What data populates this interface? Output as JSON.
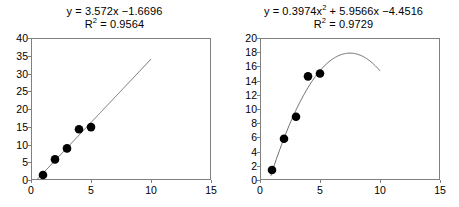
{
  "figure": {
    "background": "#ffffff",
    "point_color": "#000000",
    "line_color": "#6e6e6e",
    "axis_color": "#808080"
  },
  "chart_data": [
    {
      "type": "scatter",
      "title": "",
      "annotations": [
        {
          "text_parts": [
            "y = 3.572x −1.6696"
          ]
        },
        {
          "text_parts": [
            "R",
            "2",
            " = 0.9564"
          ]
        }
      ],
      "equation": "y = 3.572x −1.6696",
      "r_squared_label": "R",
      "r_squared_sup": "2",
      "r_squared_value": " = 0.9564",
      "xlabel": "",
      "ylabel": "",
      "xlim": [
        0,
        15
      ],
      "ylim": [
        0,
        40
      ],
      "xticks": [
        0,
        5,
        10,
        15
      ],
      "yticks": [
        0,
        5,
        10,
        15,
        20,
        25,
        30,
        35,
        40
      ],
      "xtick_labels": [
        "0",
        "5",
        "10",
        "15"
      ],
      "ytick_labels": [
        "0",
        "5",
        "10",
        "15",
        "20",
        "25",
        "30",
        "35",
        "40"
      ],
      "grid": false,
      "legend": "none",
      "x": [
        1,
        2,
        3,
        4,
        5
      ],
      "y": [
        1.4,
        5.8,
        8.9,
        14.3,
        14.9
      ],
      "trendline": {
        "kind": "linear",
        "slope": 3.572,
        "intercept": -1.6696,
        "x_start": 0.47,
        "x_end": 10.0
      }
    },
    {
      "type": "scatter",
      "title": "",
      "annotations": [
        {
          "text_parts": [
            "y = 0.3974x",
            "2",
            " + 5.9566x −4.4516"
          ]
        },
        {
          "text_parts": [
            "R",
            "2",
            " = 0.9729"
          ]
        }
      ],
      "equation_pre": "y = 0.3974x",
      "equation_sup": "2",
      "equation_post": " + 5.9566x −4.4516",
      "r_squared_label": "R",
      "r_squared_sup": "2",
      "r_squared_value": " = 0.9729",
      "xlabel": "",
      "ylabel": "",
      "xlim": [
        0,
        15
      ],
      "ylim": [
        0,
        20
      ],
      "xticks": [
        0,
        5,
        10,
        15
      ],
      "yticks": [
        0,
        2,
        4,
        6,
        8,
        10,
        12,
        14,
        16,
        18,
        20
      ],
      "xtick_labels": [
        "0",
        "5",
        "10",
        "15"
      ],
      "ytick_labels": [
        "0",
        "2",
        "4",
        "6",
        "8",
        "10",
        "12",
        "14",
        "16",
        "18",
        "20"
      ],
      "grid": false,
      "legend": "none",
      "x": [
        1,
        2,
        3,
        4,
        5
      ],
      "y": [
        1.4,
        5.8,
        8.9,
        14.6,
        15.0
      ],
      "trendline": {
        "kind": "quadratic",
        "a": -0.3974,
        "b": 5.9566,
        "c": -4.4516,
        "x_start": 0.9,
        "x_end": 10.0,
        "vertex_x": 7.5,
        "vertex_y": 17.9
      }
    }
  ]
}
